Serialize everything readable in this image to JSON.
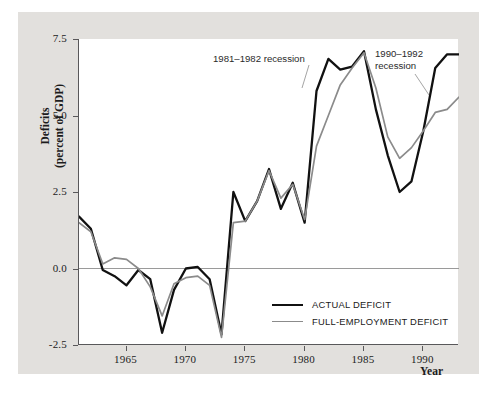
{
  "chart_data": {
    "type": "line",
    "title": "",
    "xlabel": "Year",
    "ylabel": "Deficits\n(percent of GDP)",
    "ylabel_line1": "Deficits",
    "ylabel_line2": "(percent of GDP)",
    "xlim": [
      1961,
      1993
    ],
    "ylim": [
      -2.5,
      7.5
    ],
    "yticks": [
      "7.5",
      "5.0",
      "2.5",
      "0.0",
      "-2.5"
    ],
    "ytick_values": [
      7.5,
      5.0,
      2.5,
      0.0,
      -2.5
    ],
    "xticks": [
      "1965",
      "1970",
      "1975",
      "1980",
      "1985",
      "1990"
    ],
    "xtick_values": [
      1965,
      1970,
      1975,
      1980,
      1985,
      1990
    ],
    "grid": false,
    "zero_line": true,
    "legend_position": "lower-right-inside",
    "x": [
      1961,
      1962,
      1963,
      1964,
      1965,
      1966,
      1967,
      1968,
      1969,
      1970,
      1971,
      1972,
      1973,
      1974,
      1975,
      1976,
      1977,
      1978,
      1979,
      1980,
      1981,
      1982,
      1983,
      1984,
      1985,
      1986,
      1987,
      1988,
      1989,
      1990,
      1991,
      1992,
      1993
    ],
    "series": [
      {
        "name": "ACTUAL DEFICIT",
        "color": "#111111",
        "values": [
          1.7,
          1.3,
          -0.05,
          -0.25,
          -0.55,
          -0.05,
          -0.35,
          -2.1,
          -0.7,
          0.0,
          0.05,
          -0.35,
          -2.15,
          2.5,
          1.55,
          2.2,
          3.25,
          1.95,
          2.8,
          1.5,
          5.8,
          6.85,
          6.5,
          6.6,
          7.1,
          5.2,
          3.7,
          2.5,
          2.85,
          4.5,
          6.55,
          7.0,
          7.0
        ]
      },
      {
        "name": "FULL-EMPLOYMENT DEFICIT",
        "color": "#8b8b8b",
        "values": [
          1.5,
          1.2,
          0.15,
          0.35,
          0.3,
          0.0,
          -0.6,
          -1.55,
          -0.5,
          -0.3,
          -0.25,
          -0.55,
          -2.25,
          1.5,
          1.55,
          2.2,
          3.2,
          2.3,
          2.75,
          1.6,
          4.0,
          5.0,
          6.0,
          6.55,
          7.05,
          5.9,
          4.3,
          3.6,
          3.95,
          4.5,
          5.1,
          5.2,
          5.6
        ]
      }
    ],
    "annotations": [
      {
        "id": "recession-1981-1982",
        "text": "1981–1982 recession",
        "leader_from": [
          213,
          53
        ],
        "leader_to": [
          302,
          88
        ]
      },
      {
        "id": "recession-1990-1992",
        "text": "1990–1992\nrecession",
        "leader_from": [
          375,
          48
        ],
        "leader_to": [
          429,
          95
        ]
      }
    ]
  },
  "legend": {
    "items": [
      {
        "label": "ACTUAL DEFICIT",
        "color": "#111111"
      },
      {
        "label": "FULL-EMPLOYMENT DEFICIT",
        "color": "#8b8b8b"
      }
    ]
  },
  "axes": {
    "y_title_line1": "Deficits",
    "y_title_line2": "(percent of GDP)",
    "x_title": "Year"
  }
}
